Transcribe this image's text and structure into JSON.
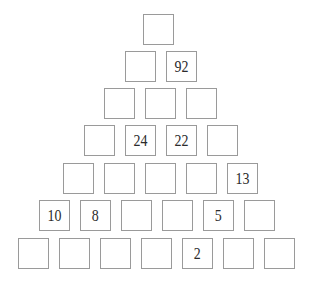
{
  "puzzle": {
    "kind": "number-pyramid",
    "rows_count": 7,
    "colors": {
      "cell_border": "#9a9a9a",
      "cell_background": "#ffffff",
      "digit_color": "#2b2b2b",
      "page_background": "#ffffff"
    },
    "rows": [
      {
        "index": 1,
        "left": 143,
        "top": 14,
        "cells": [
          {
            "value": "",
            "filled": false
          }
        ]
      },
      {
        "index": 2,
        "left": 125,
        "top": 51,
        "cells": [
          {
            "value": "",
            "filled": false
          },
          {
            "value": "92",
            "filled": true
          }
        ]
      },
      {
        "index": 3,
        "left": 104,
        "top": 88,
        "cells": [
          {
            "value": "",
            "filled": false
          },
          {
            "value": "",
            "filled": false
          },
          {
            "value": "",
            "filled": false
          }
        ]
      },
      {
        "index": 4,
        "left": 84,
        "top": 125,
        "cells": [
          {
            "value": "",
            "filled": false
          },
          {
            "value": "24",
            "filled": true
          },
          {
            "value": "22",
            "filled": true
          },
          {
            "value": "",
            "filled": false
          }
        ]
      },
      {
        "index": 5,
        "left": 63,
        "top": 163,
        "cells": [
          {
            "value": "",
            "filled": false
          },
          {
            "value": "",
            "filled": false
          },
          {
            "value": "",
            "filled": false
          },
          {
            "value": "",
            "filled": false
          },
          {
            "value": "13",
            "filled": true
          }
        ]
      },
      {
        "index": 6,
        "left": 39,
        "top": 200,
        "cells": [
          {
            "value": "10",
            "filled": true
          },
          {
            "value": "8",
            "filled": true
          },
          {
            "value": "",
            "filled": false
          },
          {
            "value": "",
            "filled": false
          },
          {
            "value": "5",
            "filled": true
          },
          {
            "value": "",
            "filled": false
          }
        ]
      },
      {
        "index": 7,
        "left": 18,
        "top": 238,
        "cells": [
          {
            "value": "",
            "filled": false
          },
          {
            "value": "",
            "filled": false
          },
          {
            "value": "",
            "filled": false
          },
          {
            "value": "",
            "filled": false
          },
          {
            "value": "2",
            "filled": true
          },
          {
            "value": "",
            "filled": false
          },
          {
            "value": "",
            "filled": false
          }
        ]
      }
    ]
  }
}
